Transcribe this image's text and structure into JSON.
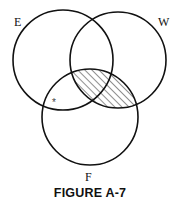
{
  "diagram": {
    "type": "venn",
    "sets": [
      {
        "id": "E",
        "label": "E",
        "cx": 63,
        "cy": 60,
        "r": 50,
        "label_x": 14,
        "label_y": 26
      },
      {
        "id": "W",
        "label": "W",
        "cx": 118,
        "cy": 60,
        "r": 48,
        "label_x": 161,
        "label_y": 26
      },
      {
        "id": "F",
        "label": "F",
        "cx": 90,
        "cy": 117,
        "r": 48,
        "label_x": 89,
        "label_y": 181
      }
    ],
    "shaded_region": "W ∩ F",
    "marker": {
      "symbol": "*",
      "region": "E ∩ F ∖ W",
      "x": 55,
      "y": 103
    },
    "stroke_color": "#111111",
    "hatch_color": "#333333"
  },
  "caption": "FIGURE A-7"
}
